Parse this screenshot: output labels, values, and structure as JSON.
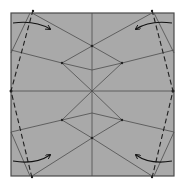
{
  "diagram": {
    "type": "origami-crease-pattern",
    "colors": {
      "paper": "#a9a9a9",
      "border": "#4a4a4a",
      "crease": "#4d4d4d",
      "valley_fold": "#1f1f1f",
      "arrow": "#111111",
      "background": "#ffffff"
    },
    "square": {
      "x": 11,
      "y": 13,
      "size": 163
    },
    "valley_lines": [
      {
        "id": "left-valley",
        "from": [
          33,
          10
        ],
        "to": [
          11,
          91
        ],
        "to2": [
          32,
          178
        ]
      },
      {
        "id": "right-valley",
        "from": [
          152,
          10
        ],
        "to": [
          173,
          91
        ],
        "to2": [
          152,
          178
        ]
      }
    ],
    "arrows": [
      {
        "id": "arrow-top-left",
        "from": [
          13,
          23
        ],
        "to": [
          50,
          29
        ]
      },
      {
        "id": "arrow-top-right",
        "from": [
          172,
          23
        ],
        "to": [
          136,
          29
        ]
      },
      {
        "id": "arrow-bottom-left",
        "from": [
          13,
          161
        ],
        "to": [
          50,
          155
        ]
      },
      {
        "id": "arrow-bottom-right",
        "from": [
          172,
          161
        ],
        "to": [
          136,
          155
        ]
      }
    ]
  }
}
